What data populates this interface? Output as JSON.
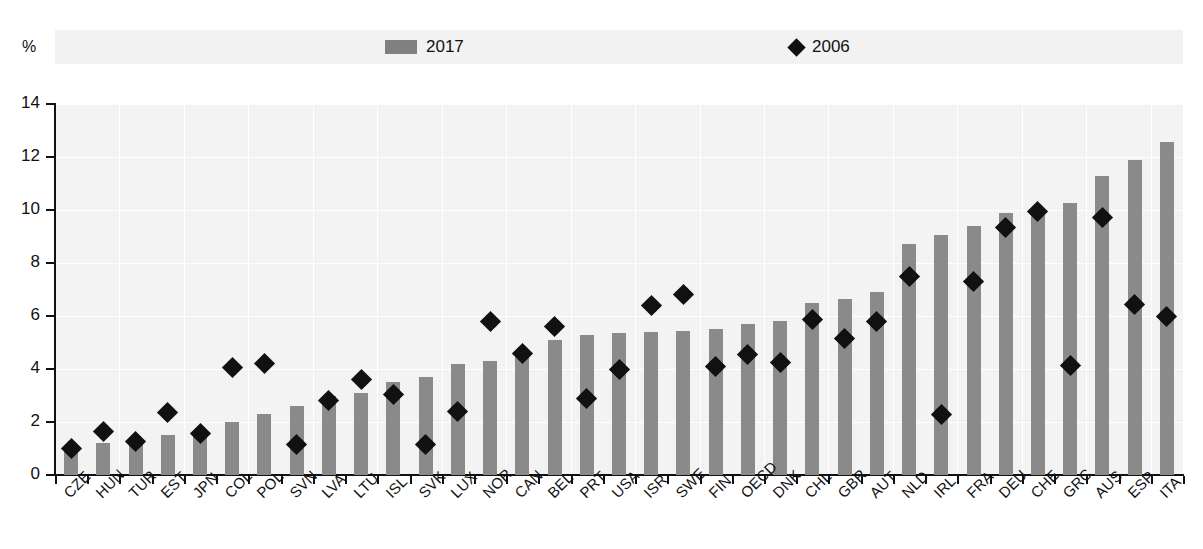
{
  "unit_label": "%",
  "legend": {
    "items": [
      {
        "label": "2017",
        "marker": "bar-swatch-icon",
        "color": "#808080"
      },
      {
        "label": "2006",
        "marker": "diamond-marker-icon",
        "color": "#111111"
      }
    ]
  },
  "axes": {
    "y_ticks": [
      "0",
      "2",
      "4",
      "6",
      "8",
      "10",
      "12",
      "14"
    ],
    "y_min": 0,
    "y_max": 14
  },
  "colors": {
    "bar": "#8a8a8a",
    "marker": "#111111",
    "plot_background": "#f3f3f3",
    "legend_background": "#f2f2f2",
    "gridline": "#ffffff",
    "axis": "#111111"
  },
  "chart_data": {
    "type": "bar",
    "title": "",
    "subtitle": "",
    "xlabel": "",
    "ylabel": "%",
    "ylim": [
      0,
      14
    ],
    "grid": true,
    "legend_position": "top",
    "categories": [
      "CZE",
      "HUN",
      "TUR",
      "EST",
      "JPN",
      "COL",
      "POL",
      "SVN",
      "LVA",
      "LTU",
      "ISL",
      "SVK",
      "LUX",
      "NOR",
      "CAN",
      "BEL",
      "PRT",
      "USA",
      "ISR",
      "SWE",
      "FIN",
      "OECD",
      "DNK",
      "CHL",
      "GBR",
      "AUT",
      "NLD",
      "IRL",
      "FRA",
      "DEU",
      "CHE",
      "GRC",
      "AUS",
      "ESP",
      "ITA"
    ],
    "series": [
      {
        "name": "2017",
        "type": "bar",
        "color": "#8a8a8a",
        "values": [
          0.9,
          1.2,
          1.2,
          1.5,
          1.5,
          2.0,
          2.3,
          2.6,
          3.0,
          3.1,
          3.5,
          3.7,
          4.2,
          4.3,
          4.6,
          5.1,
          5.3,
          5.35,
          5.4,
          5.45,
          5.5,
          5.7,
          5.8,
          6.5,
          6.65,
          6.9,
          8.7,
          9.05,
          9.4,
          9.9,
          10.0,
          10.25,
          11.3,
          11.9,
          12.55
        ]
      },
      {
        "name": "2006",
        "type": "scatter",
        "color": "#111111",
        "values": [
          1.0,
          1.65,
          1.25,
          2.35,
          1.55,
          4.05,
          4.2,
          1.15,
          2.8,
          3.6,
          3.05,
          1.15,
          2.4,
          5.8,
          4.6,
          5.6,
          2.9,
          4.0,
          6.4,
          6.8,
          4.1,
          4.55,
          4.25,
          5.85,
          5.15,
          5.8,
          7.5,
          2.3,
          7.3,
          9.35,
          9.95,
          4.15,
          9.7,
          6.45,
          6.0
        ]
      }
    ]
  }
}
